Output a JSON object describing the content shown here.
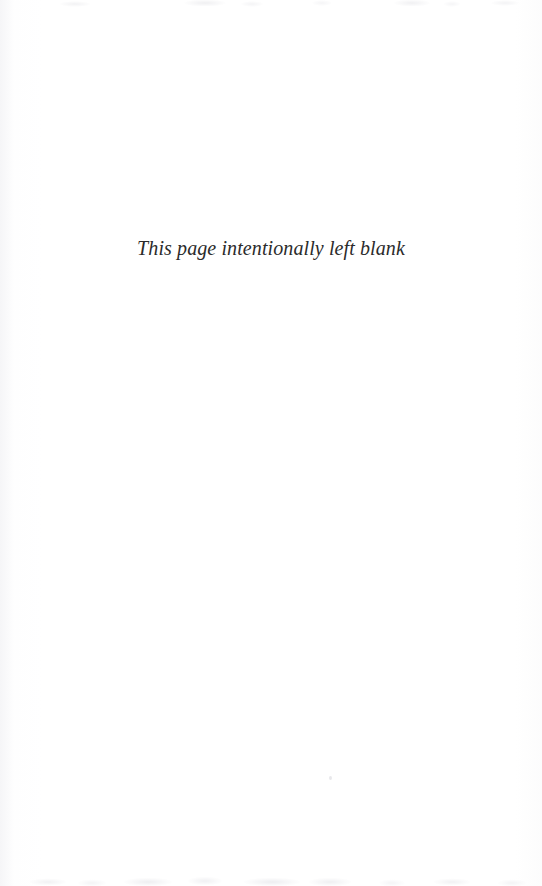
{
  "page": {
    "kind": "scanned-book-page",
    "background_color": "#ffffff",
    "width": 542,
    "height": 886
  },
  "content": {
    "notice_text": "This page intentionally left blank",
    "text_color": "#2b2b2b",
    "style": "italic-serif",
    "alignment": "center"
  },
  "artifacts": {
    "top_edge_ghosting": "faint-scan-bleed",
    "bottom_edge_ghosting": "faint-scan-bleed",
    "left_edge_vignette": "faint-paper-tone",
    "dust_speck": "single-speck"
  }
}
